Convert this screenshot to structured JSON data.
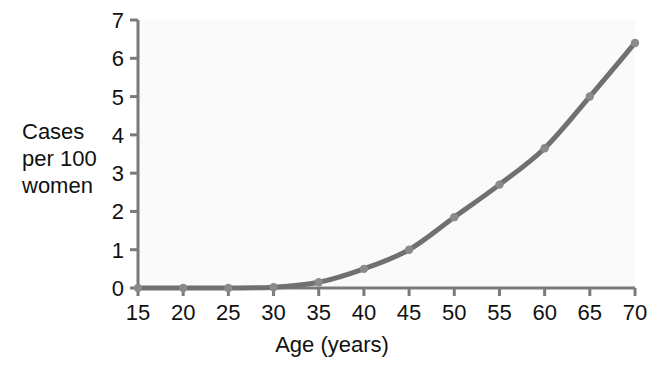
{
  "chart_data": {
    "type": "line",
    "title": "",
    "xlabel": "Age (years)",
    "ylabel": "Cases\nper 100\nwomen",
    "ylabel_lines": [
      "Cases",
      "per 100",
      "women"
    ],
    "x": [
      15,
      20,
      25,
      30,
      35,
      40,
      45,
      50,
      55,
      60,
      65,
      70
    ],
    "values": [
      0,
      0,
      0,
      0.02,
      0.15,
      0.5,
      1.0,
      1.85,
      2.7,
      3.65,
      5.0,
      6.4
    ],
    "series": [
      {
        "name": "Cases per 100 women",
        "values": [
          0,
          0,
          0,
          0.02,
          0.15,
          0.5,
          1.0,
          1.85,
          2.7,
          3.65,
          5.0,
          6.4
        ]
      }
    ],
    "xlim": [
      15,
      70
    ],
    "ylim": [
      0,
      7
    ],
    "xticks": [
      15,
      20,
      25,
      30,
      35,
      40,
      45,
      50,
      55,
      60,
      65,
      70
    ],
    "yticks": [
      0,
      1,
      2,
      3,
      4,
      5,
      6,
      7
    ],
    "xtick_labels": [
      "15",
      "20",
      "25",
      "30",
      "35",
      "40",
      "45",
      "50",
      "55",
      "60",
      "65",
      "70"
    ],
    "ytick_labels": [
      "0",
      "1",
      "2",
      "3",
      "4",
      "5",
      "6",
      "7"
    ],
    "grid": false,
    "legend": null,
    "markers": true,
    "line_color": "#707070",
    "marker_color": "#8a8a8a",
    "axis_color": "#7a7a7a",
    "plot_background": "#fafafa",
    "page_background": "#ffffff"
  }
}
